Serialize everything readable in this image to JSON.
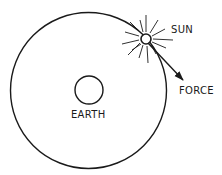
{
  "diagram": {
    "type": "orbital-force-diagram",
    "colors": {
      "ink": "#1a1a1a",
      "background": "#ffffff"
    },
    "orbit": {
      "cx": 88.5,
      "cy": 90.5,
      "r": 78
    },
    "earth": {
      "cx": 89,
      "cy": 90,
      "r": 14,
      "label": "EARTH"
    },
    "sun": {
      "cx": 146,
      "cy": 39,
      "r": 5,
      "label": "SUN",
      "rays": 14
    },
    "force": {
      "label": "FORCE",
      "from": [
        146,
        39
      ],
      "to": [
        183,
        80
      ]
    }
  }
}
